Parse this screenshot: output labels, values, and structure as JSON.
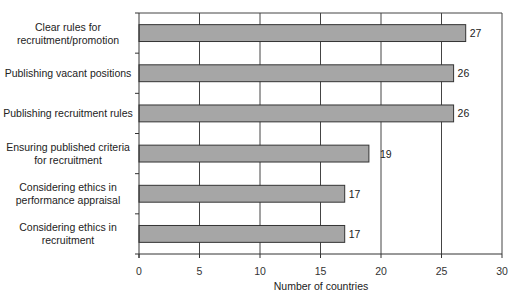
{
  "chart_data": {
    "type": "bar",
    "orientation": "horizontal",
    "title": "",
    "xlabel": "Number of countries",
    "ylabel": "",
    "xlim": [
      0,
      30
    ],
    "xticks": [
      0,
      5,
      10,
      15,
      20,
      25,
      30
    ],
    "grid": "vertical",
    "categories": [
      [
        "Clear rules for",
        "recruitment/promotion"
      ],
      [
        "Publishing vacant positions"
      ],
      [
        "Publishing recruitment rules"
      ],
      [
        "Ensuring published criteria",
        "for recruitment"
      ],
      [
        "Considering ethics in",
        "performance appraisal"
      ],
      [
        "Considering ethics in",
        "recruitment"
      ]
    ],
    "values": [
      27,
      26,
      26,
      19,
      17,
      17
    ],
    "data_labels": [
      "27",
      "26",
      "26",
      "19",
      "17",
      "17"
    ],
    "bar_color": "#a6a6a6"
  }
}
